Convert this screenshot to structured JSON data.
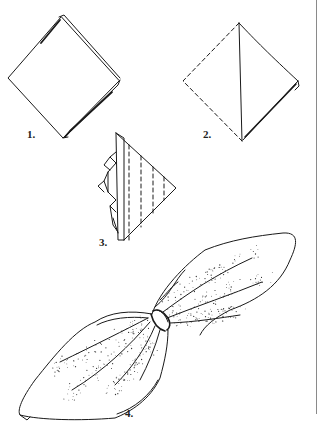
{
  "figure": {
    "steps": [
      {
        "number": "1.",
        "description": "Napkin folded into quarters, placed as a diamond"
      },
      {
        "number": "2.",
        "description": "Fold left corner over to the right, forming a triangle"
      },
      {
        "number": "3.",
        "description": "Pleat the triangle accordion-style"
      },
      {
        "number": "4.",
        "description": "Pull through napkin ring and fan out both ends"
      }
    ],
    "colors": {
      "ink": "#1a1a1a",
      "background": "#ffffff",
      "rule": "#8a8a8a"
    }
  }
}
